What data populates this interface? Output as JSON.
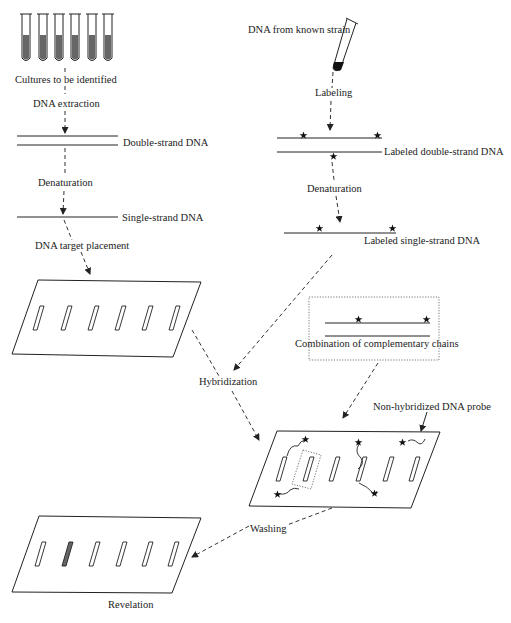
{
  "diagram": {
    "left_column": {
      "cultures_label": "Cultures to be identified",
      "tube_count": 6,
      "extraction_label": "DNA extraction",
      "double_strand_label": "Double-strand DNA",
      "denaturation_label": "Denaturation",
      "single_strand_label": "Single-strand DNA",
      "placement_label": "DNA target placement"
    },
    "right_column": {
      "known_strain_label": "DNA from known strain",
      "labeling_label": "Labeling",
      "labeled_double_label": "Labeled double-strand DNA",
      "denaturation_label": "Denaturation",
      "labeled_single_label": "Labeled single-strand DNA"
    },
    "hybridization": {
      "label": "Hybridization",
      "complementary_label": "Combination of complementary chains",
      "probe_label": "Non-hybridized DNA probe"
    },
    "washing_label": "Washing",
    "revelation_label": "Revelation",
    "membrane_slot_count": 6,
    "revealed_slot_index": 1
  }
}
